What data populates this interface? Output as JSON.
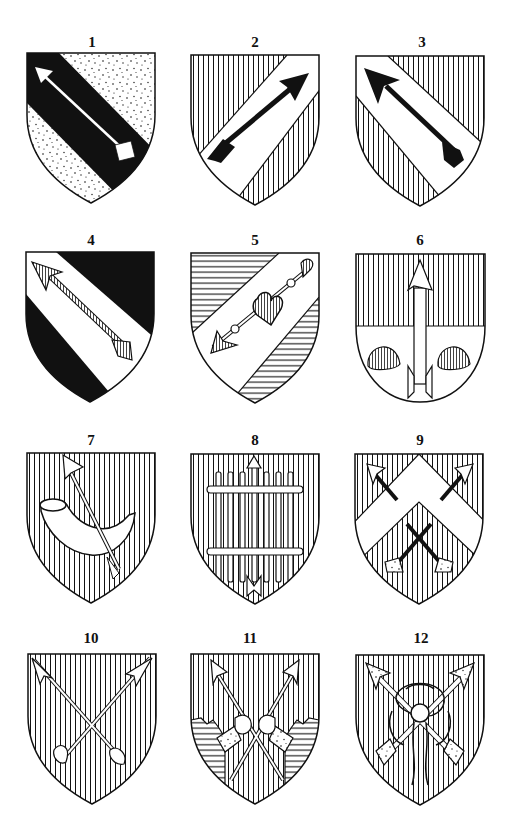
{
  "figure": {
    "colors": {
      "ink": "#111111",
      "paper": "#ffffff"
    },
    "shields": [
      {
        "number": "1",
        "field": "stippled (or)",
        "charge": "bend sable with arrow argent pointing to dexter chief"
      },
      {
        "number": "2",
        "field": "vertical hatching (gules)",
        "charge": "bend sinister argent with arrow sable pointing to sinister chief"
      },
      {
        "number": "3",
        "field": "vertical hatching (gules)",
        "charge": "bend argent with arrow sable pointing to dexter chief"
      },
      {
        "number": "4",
        "field": "sable",
        "charge": "bend argent with arrow gules pointing to dexter chief"
      },
      {
        "number": "5",
        "field": "horizontal hatching (azure)",
        "charge": "bend sinister argent with arrow piercing a heart gules, point to dexter base"
      },
      {
        "number": "6",
        "field": "per fess gules and argent",
        "charge": "arrow in pale with two escallops"
      },
      {
        "number": "7",
        "field": "vertical hatching (gules)",
        "charge": "hunting horn with arrow in bend sinister"
      },
      {
        "number": "8",
        "field": "vertical hatching (gules)",
        "charge": "sheaf of arrows bound with two bars"
      },
      {
        "number": "9",
        "field": "vertical hatching (gules)",
        "charge": "chevron argent between three arrows"
      },
      {
        "number": "10",
        "field": "vertical hatching (gules)",
        "charge": "two arrows in saltire"
      },
      {
        "number": "11",
        "field": "vertical hatching (gules)",
        "charge": "two arms issuing from clouds holding arrows in saltire"
      },
      {
        "number": "12",
        "field": "vertical hatching (gules)",
        "charge": "two arrows in saltire bound with a knot"
      }
    ]
  }
}
